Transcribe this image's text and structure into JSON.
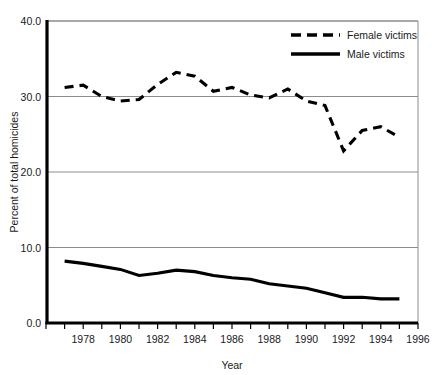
{
  "chart_data": {
    "type": "line",
    "title": "",
    "xlabel": "Year",
    "ylabel": "Percent of total homicides",
    "xlim": [
      1976,
      1996
    ],
    "ylim": [
      0.0,
      40.0
    ],
    "ytick_labels": [
      "0.0",
      "10.0",
      "20.0",
      "30.0",
      "40.0"
    ],
    "ytick_values": [
      0,
      10,
      20,
      30,
      40
    ],
    "xtick_values": [
      1976,
      1977,
      1978,
      1979,
      1980,
      1981,
      1982,
      1983,
      1984,
      1985,
      1986,
      1987,
      1988,
      1989,
      1990,
      1991,
      1992,
      1993,
      1994,
      1995,
      1996
    ],
    "xtick_labels": [
      "1978",
      "1980",
      "1982",
      "1984",
      "1986",
      "1988",
      "1990",
      "1992",
      "1994",
      "1996"
    ],
    "xtick_label_values": [
      1978,
      1980,
      1982,
      1984,
      1986,
      1988,
      1990,
      1992,
      1994,
      1996
    ],
    "grid": "horizontal",
    "legend_position": "top-right",
    "x": [
      1977,
      1978,
      1979,
      1980,
      1981,
      1982,
      1983,
      1984,
      1985,
      1986,
      1987,
      1988,
      1989,
      1990,
      1991,
      1992,
      1993,
      1994,
      1995
    ],
    "series": [
      {
        "name": "Female victims",
        "style": "dashed",
        "color": "#000000",
        "values": [
          31.2,
          31.5,
          30.0,
          29.4,
          29.6,
          31.6,
          33.2,
          32.7,
          30.7,
          31.2,
          30.2,
          29.8,
          31.0,
          29.4,
          28.8,
          22.8,
          25.5,
          26.0,
          24.6
        ]
      },
      {
        "name": "Male victims",
        "style": "solid",
        "color": "#000000",
        "values": [
          8.2,
          7.9,
          7.5,
          7.1,
          6.3,
          6.6,
          7.0,
          6.8,
          6.3,
          6.0,
          5.8,
          5.2,
          4.9,
          4.6,
          4.0,
          3.4,
          3.4,
          3.2,
          3.2
        ]
      }
    ]
  },
  "legend": {
    "items": [
      {
        "label": "Female victims",
        "style": "dashed"
      },
      {
        "label": "Male victims",
        "style": "solid"
      }
    ]
  },
  "axes": {
    "y_title": "Percent of total homicides",
    "x_title": "Year"
  }
}
